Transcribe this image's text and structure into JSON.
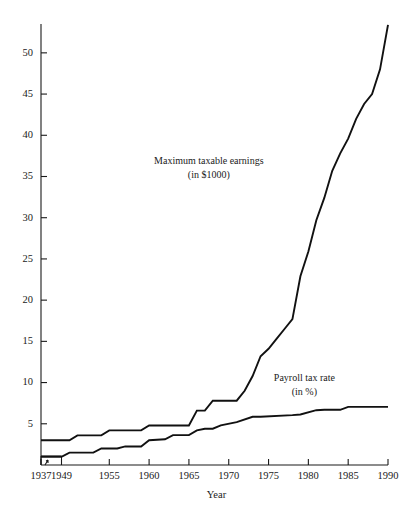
{
  "chart_data": {
    "type": "line",
    "title": "",
    "xlabel": "Year",
    "ylabel": "",
    "grid": false,
    "legend_position": "inline-annotation",
    "xlim": [
      1937,
      1990
    ],
    "ylim": [
      0,
      53.5
    ],
    "xticks": [
      1937,
      1949,
      1955,
      1960,
      1965,
      1970,
      1975,
      1980,
      1985,
      1990
    ],
    "xticklabels": [
      "1937",
      "1949",
      "1955",
      "1960",
      "1965",
      "1970",
      "1975",
      "1980",
      "1985",
      "1990"
    ],
    "yticks": [
      5,
      10,
      15,
      20,
      25,
      30,
      35,
      40,
      45,
      50
    ],
    "yticklabels": [
      "5",
      "10",
      "15",
      "20",
      "25",
      "30",
      "35",
      "40",
      "45",
      "50"
    ],
    "annotations": [
      {
        "id": "max-earnings-label",
        "line1": "Maximum taxable earnings",
        "line2": "(in $1000)",
        "x": 1967.5,
        "y": 36.5
      },
      {
        "id": "payroll-rate-label",
        "line1": "Payroll tax rate",
        "line2": "(in %)",
        "x": 1979.5,
        "y": 10.2
      }
    ],
    "series": [
      {
        "name": "Maximum taxable earnings",
        "units": "$1000",
        "x": [
          1937,
          1950,
          1951,
          1954,
          1955,
          1959,
          1960,
          1965,
          1966,
          1967,
          1968,
          1971,
          1972,
          1973,
          1974,
          1975,
          1976,
          1977,
          1978,
          1979,
          1980,
          1981,
          1982,
          1983,
          1984,
          1985,
          1986,
          1987,
          1988,
          1989,
          1990
        ],
        "values": [
          3.0,
          3.0,
          3.6,
          3.6,
          4.2,
          4.2,
          4.8,
          4.8,
          6.6,
          6.6,
          7.8,
          7.8,
          9.0,
          10.8,
          13.2,
          14.1,
          15.3,
          16.5,
          17.7,
          22.9,
          25.9,
          29.7,
          32.4,
          35.7,
          37.8,
          39.6,
          42.0,
          43.8,
          45.0,
          48.0,
          53.4
        ]
      },
      {
        "name": "Payroll tax rate",
        "units": "%",
        "x": [
          1937,
          1949,
          1950,
          1953,
          1954,
          1956,
          1957,
          1959,
          1960,
          1962,
          1963,
          1965,
          1966,
          1967,
          1968,
          1969,
          1971,
          1973,
          1974,
          1978,
          1979,
          1981,
          1982,
          1984,
          1985,
          1988,
          1990
        ],
        "values": [
          1.0,
          1.0,
          1.5,
          1.5,
          2.0,
          2.0,
          2.25,
          2.25,
          3.0,
          3.125,
          3.625,
          3.625,
          4.2,
          4.4,
          4.4,
          4.8,
          5.2,
          5.85,
          5.85,
          6.05,
          6.13,
          6.65,
          6.7,
          6.7,
          7.05,
          7.05,
          7.05
        ]
      }
    ]
  },
  "figure": {
    "background_color": "#ffffff",
    "line_color": "#111111",
    "axis_color": "#1a1a1a"
  }
}
